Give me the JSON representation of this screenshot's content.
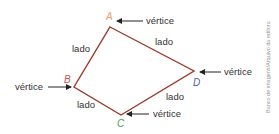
{
  "diagram": {
    "type": "quadrilateral",
    "vertices": [
      {
        "name": "A",
        "x": 110,
        "y": 27,
        "label_color": "#e8a070"
      },
      {
        "name": "B",
        "x": 74,
        "y": 87,
        "label_color": "#d05050"
      },
      {
        "name": "C",
        "x": 121,
        "y": 115,
        "label_color": "#4a9a5a"
      },
      {
        "name": "D",
        "x": 194,
        "y": 71,
        "label_color": "#4a5ea8"
      }
    ],
    "stroke_color": "#9b3a2a",
    "vertex_annotation": "vértice",
    "side_annotation": "lado",
    "side_labels": [
      "lado",
      "lado",
      "lado",
      "lado"
    ],
    "vertex_labels": [
      "vértice",
      "vértice",
      "vértice",
      "vértice"
    ]
  },
  "credit": "Banco de imagens/Arquivo da editora"
}
